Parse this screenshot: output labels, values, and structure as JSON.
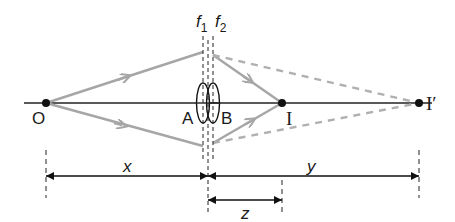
{
  "diagram": {
    "type": "optics-ray-diagram",
    "colors": {
      "axis": "#222222",
      "ray": "#a6a6a6",
      "dashed_ray": "#a6a6a6",
      "point": "#111111",
      "dimension": "#111111"
    },
    "labels": {
      "object": "O",
      "lens_a": "A",
      "lens_b": "B",
      "image": "I",
      "image_prime": "I′",
      "focal_1_base": "f",
      "focal_1_sub": "1",
      "focal_2_base": "f",
      "focal_2_sub": "2",
      "dim_x": "x",
      "dim_y": "y",
      "dim_z": "z"
    },
    "points": {
      "O": [
        46,
        103
      ],
      "I": [
        282,
        103
      ],
      "I_prime": [
        419,
        103
      ]
    },
    "lenses": [
      {
        "name": "A",
        "cx": 203
      },
      {
        "name": "B",
        "cx": 213
      }
    ],
    "dimensions": [
      {
        "name": "x",
        "from": 46,
        "to": 208,
        "y": 176
      },
      {
        "name": "y",
        "from": 208,
        "to": 419,
        "y": 176
      },
      {
        "name": "z",
        "from": 208,
        "to": 282,
        "y": 200
      }
    ]
  }
}
